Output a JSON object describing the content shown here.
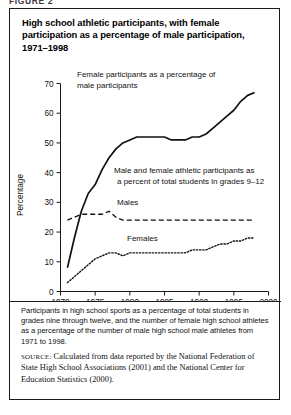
{
  "figure_label": "FIGURE 2",
  "panel": {
    "title": "High school athletic participants, with female participation as a percentage of male participation, 1971–1998",
    "note": "Participants in high school sports as a percentage of total students in grades nine through twelve, and the number of female high school athletes as a percentage of the number of male high school male athletes from 1971 to 1998.",
    "source_label": "SOURCE:",
    "source_text": "Calculated from data reported by the National Federation of State High School Associations (2001) and the National Center for Education Statistics (2000)."
  },
  "chart_data": {
    "type": "line",
    "title": "High school athletic participants, with female participation as a percentage of male participation, 1971–1998",
    "xlabel": "",
    "ylabel": "Percentage",
    "xlim": [
      1970,
      2000
    ],
    "ylim": [
      0,
      70
    ],
    "xticks": [
      1970,
      1975,
      1980,
      1985,
      1990,
      1995,
      2000
    ],
    "xtick_labels": [
      "1970",
      "1975",
      "1980",
      "1985",
      "1990",
      "1995",
      "2000"
    ],
    "yticks": [
      0,
      10,
      20,
      30,
      40,
      50,
      60,
      70
    ],
    "ytick_labels": [
      "0",
      "10",
      "20",
      "30",
      "40",
      "50",
      "60",
      "70"
    ],
    "grid": false,
    "legend_position": "inline-annotations",
    "annotations": [
      {
        "name": "female-pct-of-male-annotation",
        "lines": [
          "Female participants as a percentage of",
          "male participants"
        ]
      },
      {
        "name": "total-students-annotation",
        "lines": [
          "Male and female athletic participants as",
          "a percent of total students in grades 9–12"
        ]
      }
    ],
    "series": [
      {
        "name": "Female participants as a percentage of male participants",
        "label": "",
        "style": "solid",
        "x": [
          1971,
          1972,
          1973,
          1974,
          1975,
          1976,
          1977,
          1978,
          1979,
          1980,
          1981,
          1982,
          1983,
          1984,
          1985,
          1986,
          1987,
          1988,
          1989,
          1990,
          1991,
          1992,
          1993,
          1994,
          1995,
          1996,
          1997,
          1998
        ],
        "values": [
          8,
          18,
          27,
          33,
          36,
          41,
          45,
          48,
          50,
          51,
          52,
          52,
          52,
          52,
          52,
          51,
          51,
          51,
          52,
          52,
          53,
          55,
          57,
          59,
          61,
          64,
          66,
          67
        ]
      },
      {
        "name": "Males as a percent of total students in grades 9-12",
        "label": "Males",
        "style": "dashed",
        "x": [
          1971,
          1972,
          1973,
          1974,
          1975,
          1976,
          1977,
          1978,
          1979,
          1980,
          1981,
          1982,
          1983,
          1984,
          1985,
          1986,
          1987,
          1988,
          1989,
          1990,
          1991,
          1992,
          1993,
          1994,
          1995,
          1996,
          1997,
          1998
        ],
        "values": [
          24,
          25,
          26,
          26,
          26,
          26,
          27,
          25,
          24,
          24,
          24,
          24,
          24,
          24,
          24,
          24,
          24,
          24,
          24,
          24,
          24,
          24,
          24,
          24,
          24,
          24,
          24,
          24
        ]
      },
      {
        "name": "Females as a percent of total students in grades 9-12",
        "label": "Females",
        "style": "dotted",
        "x": [
          1971,
          1972,
          1973,
          1974,
          1975,
          1976,
          1977,
          1978,
          1979,
          1980,
          1981,
          1982,
          1983,
          1984,
          1985,
          1986,
          1987,
          1988,
          1989,
          1990,
          1991,
          1992,
          1993,
          1994,
          1995,
          1996,
          1997,
          1998
        ],
        "values": [
          3,
          5,
          7,
          9,
          11,
          12,
          13,
          13,
          12,
          13,
          13,
          13,
          13,
          13,
          13,
          13,
          13,
          13,
          14,
          14,
          14,
          15,
          16,
          16,
          17,
          17,
          18,
          18
        ]
      }
    ]
  }
}
